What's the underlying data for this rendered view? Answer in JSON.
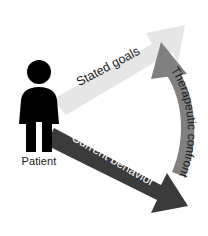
{
  "diagram": {
    "background_color": "#ffffff",
    "figure": {
      "icon": "person-icon",
      "label": "Patient",
      "color": "#000000"
    },
    "arrows": [
      {
        "id": "stated-goals",
        "label": "Stated goals",
        "color": "#e6e6e6",
        "text_color": "#1a1a1a",
        "direction": "up-right",
        "rotation_deg": -28
      },
      {
        "id": "current-behavior",
        "label": "Current behavior",
        "color": "#3b3b3b",
        "text_color": "#ffffff",
        "direction": "down-right",
        "rotation_deg": 30
      },
      {
        "id": "therapeutic-confrontation",
        "label": "Therapeutic confrontation",
        "color": "#808080",
        "text_color": "#1a1a1a",
        "direction": "curved-upward",
        "rotation_deg": 90
      }
    ]
  }
}
